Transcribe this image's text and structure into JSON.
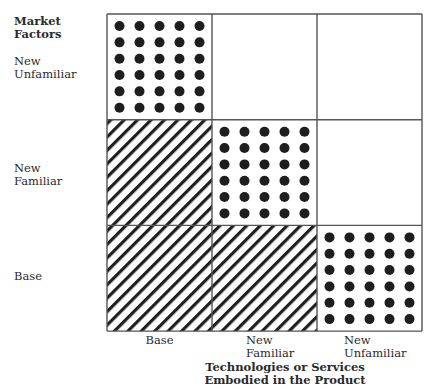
{
  "y_axis": {
    "title": "Market\nFactors",
    "labels": [
      "New\nUnfamiliar",
      "New\nFamiliar",
      "Base"
    ]
  },
  "x_axis": {
    "title": "Technologies or Services\nEmbodied in the Product",
    "labels": [
      "Base",
      "New\nFamiliar",
      "New\nUnfamiliar"
    ]
  },
  "grid": {
    "rows": [
      "New Unfamiliar",
      "New Familiar",
      "Base"
    ],
    "cols": [
      "Base",
      "New Familiar",
      "New Unfamiliar"
    ],
    "cells": [
      [
        "dots",
        "blank",
        "blank"
      ],
      [
        "hatch",
        "dots",
        "blank"
      ],
      [
        "hatch",
        "hatch",
        "dots"
      ]
    ],
    "dot_cols": 5,
    "dot_rows": 6
  },
  "colors": {
    "line": "#555555",
    "fill": "#1e1e1e"
  }
}
